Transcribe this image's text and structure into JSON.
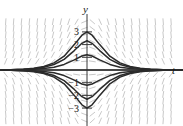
{
  "figure": {
    "name": "direction-field-plot",
    "background_color": "#ffffff",
    "axis_color": "#3a3a3a",
    "curve_color": "#2b2b2b",
    "slope_field_color": "#c9c9c9"
  },
  "axes": {
    "x_axis_label": "t",
    "y_axis_label": "y",
    "origin_px": {
      "x": 87,
      "y": 70
    },
    "unit_px": 12.7,
    "x_range": [
      -6.85,
      7.56
    ],
    "y_range": [
      -4.41,
      5.51
    ]
  },
  "y_ticks": [
    {
      "value": 3,
      "label": "3"
    },
    {
      "value": 2,
      "label": "2"
    },
    {
      "value": 1,
      "label": "1"
    },
    {
      "value": -1,
      "label": "−1"
    },
    {
      "value": -2,
      "label": "−2"
    },
    {
      "value": -3,
      "label": "−3"
    }
  ],
  "chart_data": {
    "type": "line",
    "title": "",
    "xlabel": "t",
    "ylabel": "y",
    "xlim": [
      -6.85,
      7.56
    ],
    "ylim": [
      -4.41,
      5.51
    ],
    "grid": false,
    "legend": "none",
    "annotations": [],
    "x": [
      -6.85,
      -6.0,
      -5.0,
      -4.2,
      -3.4,
      -2.6,
      -1.8,
      -1.0,
      -0.4,
      0,
      0.4,
      1.0,
      1.8,
      2.6,
      3.4,
      4.2,
      5.0,
      6.0,
      7.56
    ],
    "series": [
      {
        "name": "curve-peak-3",
        "peak": 3.0,
        "values": [
          0.0,
          0.02,
          0.06,
          0.13,
          0.27,
          0.56,
          1.09,
          2.0,
          2.74,
          3.0,
          2.74,
          2.0,
          1.09,
          0.56,
          0.27,
          0.13,
          0.06,
          0.02,
          0.0
        ]
      },
      {
        "name": "curve-peak-2-3",
        "peak": 2.3,
        "values": [
          0.0,
          0.02,
          0.05,
          0.1,
          0.21,
          0.43,
          0.84,
          1.53,
          2.1,
          2.3,
          2.1,
          1.53,
          0.84,
          0.43,
          0.21,
          0.1,
          0.05,
          0.02,
          0.0
        ]
      },
      {
        "name": "curve-peak-1-2",
        "peak": 1.2,
        "values": [
          0.0,
          0.01,
          0.03,
          0.05,
          0.11,
          0.22,
          0.44,
          0.8,
          1.1,
          1.2,
          1.1,
          0.8,
          0.44,
          0.22,
          0.11,
          0.05,
          0.03,
          0.01,
          0.0
        ]
      },
      {
        "name": "curve-equilibrium",
        "peak": 0.0,
        "values": [
          0.0,
          0.0,
          0.0,
          0.0,
          0.0,
          0.0,
          0.0,
          0.0,
          0.0,
          0.0,
          0.0,
          0.0,
          0.0,
          0.0,
          0.0,
          0.0,
          0.0,
          0.0,
          0.0
        ]
      },
      {
        "name": "curve-trough-1-2",
        "peak": -1.2,
        "values": [
          0.0,
          -0.01,
          -0.03,
          -0.05,
          -0.11,
          -0.22,
          -0.44,
          -0.8,
          -1.1,
          -1.2,
          -1.1,
          -0.8,
          -0.44,
          -0.22,
          -0.11,
          -0.05,
          -0.03,
          -0.01,
          0.0
        ]
      },
      {
        "name": "curve-trough-2-3",
        "peak": -2.3,
        "values": [
          0.0,
          -0.02,
          -0.05,
          -0.1,
          -0.21,
          -0.43,
          -0.84,
          -1.53,
          -2.1,
          -2.3,
          -2.1,
          -1.53,
          -0.84,
          -0.43,
          -0.21,
          -0.1,
          -0.05,
          -0.02,
          0.0
        ]
      },
      {
        "name": "curve-trough-3",
        "peak": -3.0,
        "values": [
          0.0,
          -0.02,
          -0.06,
          -0.13,
          -0.27,
          -0.56,
          -1.09,
          -2.0,
          -2.74,
          -3.0,
          -2.74,
          -2.0,
          -1.09,
          -0.56,
          -0.27,
          -0.13,
          -0.06,
          -0.02,
          0.0
        ]
      }
    ]
  }
}
